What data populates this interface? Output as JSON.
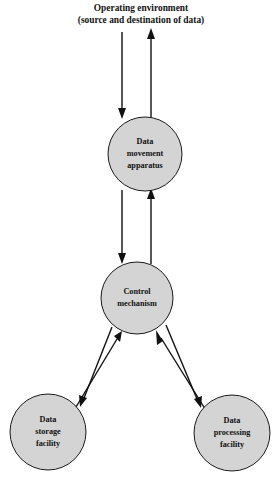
{
  "diagram": {
    "caption": {
      "line1": "Operating environment",
      "line2": "(source and destination of data)"
    },
    "colors": {
      "node_fill": "#d4d4d4",
      "node_stroke": "#1a1a1a",
      "connector": "#111111",
      "background": "#ffffff",
      "text": "#111111"
    },
    "nodes": [
      {
        "id": "data-movement-apparatus",
        "lines": [
          "Data",
          "movement",
          "apparatus"
        ],
        "cx": 145,
        "cy": 154,
        "r": 37
      },
      {
        "id": "control-mechanism",
        "lines": [
          "Control",
          "mechanism"
        ],
        "cx": 137,
        "cy": 298,
        "r": 36
      },
      {
        "id": "data-storage-facility",
        "lines": [
          "Data",
          "storage",
          "facility"
        ],
        "cx": 48,
        "cy": 432,
        "r": 38
      },
      {
        "id": "data-processing-facility",
        "lines": [
          "Data",
          "processing",
          "facility"
        ],
        "cx": 232,
        "cy": 433,
        "r": 38
      }
    ],
    "connectors": [
      {
        "id": "environment-to-apparatus",
        "direction": "down",
        "from": "operating-environment",
        "to": "data-movement-apparatus"
      },
      {
        "id": "apparatus-to-environment",
        "direction": "up",
        "from": "data-movement-apparatus",
        "to": "operating-environment"
      },
      {
        "id": "apparatus-to-control",
        "direction": "down",
        "from": "data-movement-apparatus",
        "to": "control-mechanism"
      },
      {
        "id": "control-to-apparatus",
        "direction": "up",
        "from": "control-mechanism",
        "to": "data-movement-apparatus"
      },
      {
        "id": "control-to-storage",
        "direction": "down-left",
        "from": "control-mechanism",
        "to": "data-storage-facility"
      },
      {
        "id": "storage-to-control",
        "direction": "up-right",
        "from": "data-storage-facility",
        "to": "control-mechanism"
      },
      {
        "id": "control-to-processing",
        "direction": "down-right",
        "from": "control-mechanism",
        "to": "data-processing-facility"
      },
      {
        "id": "processing-to-control",
        "direction": "up-left",
        "from": "data-processing-facility",
        "to": "control-mechanism"
      }
    ]
  }
}
